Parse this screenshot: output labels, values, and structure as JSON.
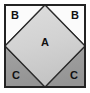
{
  "figure": {
    "frame": {
      "border_color": "#232323",
      "border_width": 2,
      "background_color": "#ffffff",
      "x": 5,
      "y": 5,
      "width": 80,
      "height": 82
    },
    "regions": [
      {
        "id": "diamond-a",
        "label": "A",
        "shape": "diamond",
        "fill": "#d2d2d2",
        "fill_top": "#dcdcdc",
        "fill_bottom": "#c6c6c6",
        "stroke": "#2a2a2a",
        "label_x": 45,
        "label_y": 42
      },
      {
        "id": "triangle-b-top-left",
        "label": "B",
        "shape": "triangle",
        "position": "top-left",
        "fill": "#fbfbfb",
        "stroke": "#2a2a2a",
        "label_x": 15,
        "label_y": 15
      },
      {
        "id": "triangle-b-top-right",
        "label": "B",
        "shape": "triangle",
        "position": "top-right",
        "fill": "#fbfbfb",
        "stroke": "#2a2a2a",
        "label_x": 75,
        "label_y": 15
      },
      {
        "id": "triangle-c-bottom-left",
        "label": "C",
        "shape": "triangle",
        "position": "bottom-left",
        "fill": "#9a9a9a",
        "stroke": "#2a2a2a",
        "label_x": 16,
        "label_y": 75
      },
      {
        "id": "triangle-c-bottom-right",
        "label": "C",
        "shape": "triangle",
        "position": "bottom-right",
        "fill": "#9a9a9a",
        "stroke": "#2a2a2a",
        "label_x": 74,
        "label_y": 75
      }
    ]
  }
}
